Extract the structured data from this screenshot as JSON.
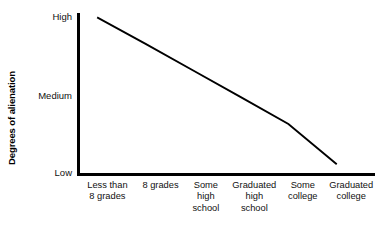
{
  "chart_data": {
    "type": "line",
    "title": "",
    "xlabel": "",
    "ylabel": "Degrees of alienation",
    "categories": [
      "Less than 8 grades",
      "8 grades",
      "Some high school",
      "Graduated high school",
      "Some college",
      "Graduated college"
    ],
    "category_lines": [
      [
        "Less than",
        "8 grades"
      ],
      [
        "8 grades"
      ],
      [
        "Some",
        "high",
        "school"
      ],
      [
        "Graduated",
        "high",
        "school"
      ],
      [
        "Some",
        "college"
      ],
      [
        "Graduated",
        "college"
      ]
    ],
    "y_tick_labels": [
      "High",
      "Medium",
      "Low"
    ],
    "ylim": [
      0,
      2
    ],
    "y_tick_values": [
      2,
      1,
      0
    ],
    "series": [
      {
        "name": "Alienation",
        "values": [
          1.94,
          1.62,
          1.29,
          0.96,
          0.63,
          0.14
        ],
        "color": "#000000"
      }
    ],
    "grid": false,
    "legend": "none",
    "line_start_label": "High",
    "line_end_label": "Low"
  },
  "axes": {
    "axis_color": "#000000",
    "y_axis_title": "Degrees of alienation"
  }
}
